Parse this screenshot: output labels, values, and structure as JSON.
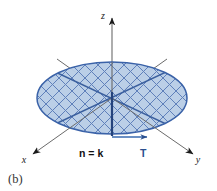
{
  "figure": {
    "panel_label": "(b)",
    "caption_visible_text": "(b)",
    "axes": [
      {
        "name": "x",
        "label": "x",
        "direction": "lower-left"
      },
      {
        "name": "y",
        "label": "y",
        "direction": "lower-right"
      },
      {
        "name": "z",
        "label": "z",
        "direction": "up"
      }
    ],
    "vectors": [
      {
        "name": "normal",
        "label": "n = k",
        "color": "#111111",
        "direction": "up-along-z"
      },
      {
        "name": "tangent",
        "label": "T",
        "color": "#2b4f8e",
        "direction": "right-along-y"
      }
    ],
    "surface": {
      "name": "disk",
      "shape": "ellipse",
      "fill_color": "#b9cde6",
      "stroke_color": "#3a62a8",
      "hatch_color": "#5a7cb8",
      "hatch_style": "crosshatch-diagonal"
    },
    "colors": {
      "axis": "#6b6b6b",
      "arrowhead": "#1a1a1a",
      "accent_blue": "#2b4f8e",
      "disk_fill": "#b9cde6",
      "disk_stroke": "#3a62a8",
      "hatch": "#5a7cb8",
      "background": "#ffffff"
    }
  }
}
